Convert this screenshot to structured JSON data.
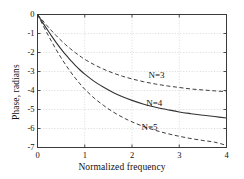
{
  "chart_data": {
    "type": "line",
    "title": "",
    "xlabel": "Normalized frequency",
    "ylabel": "Phase, radians",
    "xlim": [
      0,
      4
    ],
    "ylim": [
      -7,
      0
    ],
    "xticks": [
      "0",
      "1",
      "2",
      "3",
      "4"
    ],
    "yticks": [
      "0",
      "-1",
      "-2",
      "-3",
      "-4",
      "-5",
      "-6",
      "-7"
    ],
    "grid": true,
    "legend_position": "inline-annotations",
    "x": [
      0,
      0.1,
      0.2,
      0.3,
      0.4,
      0.5,
      0.6,
      0.7,
      0.8,
      0.9,
      1.0,
      1.2,
      1.4,
      1.6,
      1.8,
      2.0,
      2.25,
      2.5,
      2.75,
      3.0,
      3.25,
      3.5,
      3.75,
      4.0
    ],
    "series": [
      {
        "name": "N=3",
        "label": "N=3",
        "style": "dashed",
        "color": "#333333",
        "values": [
          0,
          -0.29,
          -0.58,
          -0.86,
          -1.12,
          -1.37,
          -1.6,
          -1.81,
          -2.01,
          -2.19,
          -2.36,
          -2.64,
          -2.88,
          -3.08,
          -3.25,
          -3.39,
          -3.54,
          -3.66,
          -3.76,
          -3.84,
          -3.92,
          -3.97,
          -4.02,
          -4.06
        ]
      },
      {
        "name": "N=4",
        "label": "N=4",
        "style": "solid",
        "color": "#333333",
        "values": [
          0,
          -0.39,
          -0.77,
          -1.14,
          -1.49,
          -1.82,
          -2.13,
          -2.41,
          -2.68,
          -2.92,
          -3.14,
          -3.52,
          -3.83,
          -4.1,
          -4.33,
          -4.52,
          -4.72,
          -4.88,
          -5.01,
          -5.13,
          -5.22,
          -5.3,
          -5.37,
          -5.45
        ]
      },
      {
        "name": "N=5",
        "label": "N=5",
        "style": "dashed",
        "color": "#333333",
        "values": [
          0,
          -0.49,
          -0.97,
          -1.43,
          -1.87,
          -2.28,
          -2.66,
          -3.02,
          -3.35,
          -3.65,
          -3.93,
          -4.4,
          -4.79,
          -5.13,
          -5.41,
          -5.65,
          -5.9,
          -6.1,
          -6.27,
          -6.41,
          -6.53,
          -6.63,
          -6.72,
          -6.89
        ]
      }
    ],
    "annotations": [
      {
        "text": "N=3",
        "x": 2.35,
        "y": -3.25
      },
      {
        "text": "N=4",
        "x": 2.3,
        "y": -4.7
      },
      {
        "text": "N=5",
        "x": 2.2,
        "y": -5.95
      }
    ]
  },
  "axes": {
    "xlabel": "Normalized frequency",
    "ylabel": "Phase, radians"
  }
}
